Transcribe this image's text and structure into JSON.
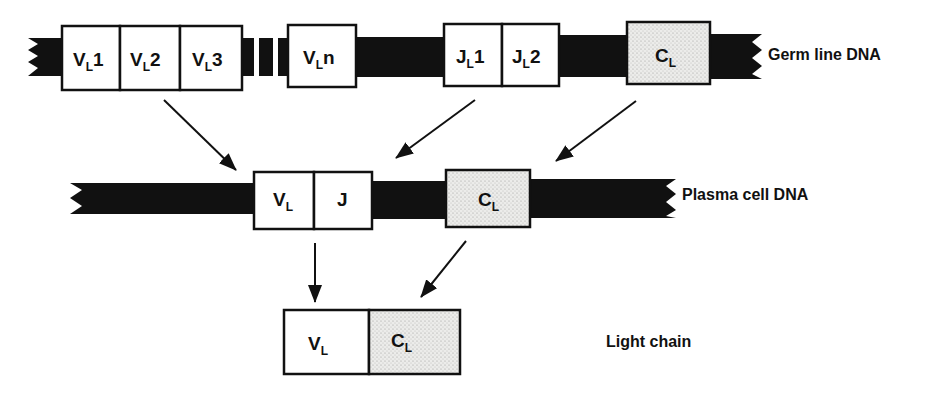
{
  "diagram": {
    "colors": {
      "dna": "#111111",
      "box_fill": "#ffffff",
      "constant_fill": "#e8e8e6",
      "stroke": "#111111"
    },
    "rows": [
      {
        "id": "germline",
        "label": "Germ line DNA",
        "segments": [
          {
            "id": "vl1",
            "main": "V",
            "sub": "L",
            "suffix": "1",
            "type": "variable"
          },
          {
            "id": "vl2",
            "main": "V",
            "sub": "L",
            "suffix": "2",
            "type": "variable"
          },
          {
            "id": "vl3",
            "main": "V",
            "sub": "L",
            "suffix": "3",
            "type": "variable"
          },
          {
            "id": "vln",
            "main": "V",
            "sub": "L",
            "suffix": "n",
            "type": "variable"
          },
          {
            "id": "jl1",
            "main": "J",
            "sub": "L",
            "suffix": "1",
            "type": "joining"
          },
          {
            "id": "jl2",
            "main": "J",
            "sub": "L",
            "suffix": "2",
            "type": "joining"
          },
          {
            "id": "cl",
            "main": "C",
            "sub": "L",
            "suffix": "",
            "type": "constant"
          }
        ]
      },
      {
        "id": "plasma",
        "label": "Plasma cell DNA",
        "segments": [
          {
            "id": "vl",
            "main": "V",
            "sub": "L",
            "suffix": "",
            "type": "variable"
          },
          {
            "id": "j",
            "main": "J",
            "sub": "",
            "suffix": "",
            "type": "joining"
          },
          {
            "id": "cl",
            "main": "C",
            "sub": "L",
            "suffix": "",
            "type": "constant"
          }
        ]
      },
      {
        "id": "light-chain",
        "label": "Light chain",
        "segments": [
          {
            "id": "vl",
            "main": "V",
            "sub": "L",
            "suffix": "",
            "type": "variable"
          },
          {
            "id": "cl",
            "main": "C",
            "sub": "L",
            "suffix": "",
            "type": "constant"
          }
        ]
      }
    ],
    "arrows": [
      {
        "from": "germline.vl",
        "to": "plasma.vl"
      },
      {
        "from": "germline.jl",
        "to": "plasma.j"
      },
      {
        "from": "germline.cl",
        "to": "plasma.cl"
      },
      {
        "from": "plasma.vl",
        "to": "light-chain.vl"
      },
      {
        "from": "plasma.cl",
        "to": "light-chain.cl"
      }
    ]
  }
}
